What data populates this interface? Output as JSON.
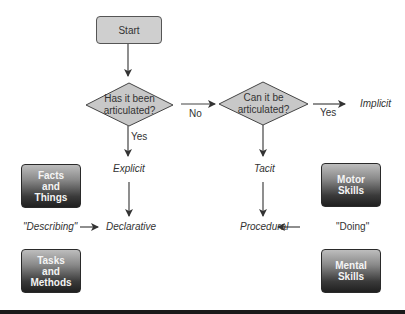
{
  "diagram": {
    "type": "flowchart",
    "start": {
      "label": "Start"
    },
    "decisions": [
      {
        "id": "articulated",
        "line1": "Has it been",
        "line2": "articulated?"
      },
      {
        "id": "can_articulate",
        "line1": "Can it be",
        "line2": "articulated?"
      }
    ],
    "edge_labels": {
      "no": "No",
      "yes_down": "Yes",
      "yes_right": "Yes"
    },
    "outcomes": {
      "implicit": "Implicit",
      "explicit": "Explicit",
      "tacit": "Tacit",
      "declarative": "Declarative",
      "procedural": "Procedural"
    },
    "side_labels": {
      "describing": "\"Describing\"",
      "doing": "\"Doing\""
    },
    "category_boxes": {
      "facts": {
        "line1": "Facts",
        "line2": "and",
        "line3": "Things"
      },
      "tasks": {
        "line1": "Tasks",
        "line2": "and",
        "line3": "Methods"
      },
      "motor": {
        "line1": "Motor",
        "line2": "Skills"
      },
      "mental": {
        "line1": "Mental",
        "line2": "Skills"
      }
    },
    "colors": {
      "start_fill": "#cfcfcf",
      "decision_fill": "#c8c8c8",
      "stroke": "#444444",
      "dark_box_bottom": "#202020"
    }
  }
}
